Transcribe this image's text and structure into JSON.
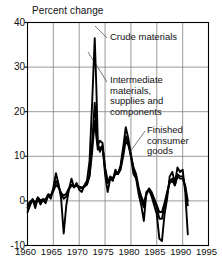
{
  "chart_data": {
    "type": "line",
    "title": "Percent change",
    "xlabel": "",
    "ylabel": "",
    "xlim": [
      1960,
      1995
    ],
    "ylim": [
      -10,
      40
    ],
    "grid": true,
    "legend_position": "inline-annotations",
    "x_ticks": [
      "1960",
      "1965",
      "1970",
      "1975",
      "1980",
      "1985",
      "1990",
      "1995"
    ],
    "x_tick_values": [
      1960,
      1965,
      1970,
      1975,
      1980,
      1985,
      1990,
      1995
    ],
    "y_ticks": [
      "-10",
      "0",
      "10",
      "20",
      "30",
      "40"
    ],
    "y_tick_values": [
      -10,
      0,
      10,
      20,
      30,
      40
    ],
    "annotations": [
      {
        "name": "crude-materials",
        "text": "Crude materials",
        "lines": [
          "Crude materials"
        ]
      },
      {
        "name": "intermediate-materials",
        "text": "Intermediate materials, supplies and components",
        "lines": [
          "Intermediate",
          "materials,",
          "supplies and",
          "components"
        ]
      },
      {
        "name": "finished-consumer-goods",
        "text": "Finished consumer goods",
        "lines": [
          "Finished",
          "consumer",
          "goods"
        ]
      }
    ],
    "x": [
      1960.0,
      1960.5,
      1961.0,
      1961.5,
      1962.0,
      1962.5,
      1963.0,
      1963.5,
      1964.0,
      1964.5,
      1965.0,
      1965.5,
      1966.0,
      1966.5,
      1967.0,
      1967.5,
      1968.0,
      1968.5,
      1969.0,
      1969.5,
      1970.0,
      1970.5,
      1971.0,
      1971.5,
      1972.0,
      1972.5,
      1973.0,
      1973.3,
      1973.6,
      1974.0,
      1974.5,
      1975.0,
      1975.5,
      1976.0,
      1976.5,
      1977.0,
      1977.5,
      1978.0,
      1978.5,
      1979.0,
      1979.5,
      1980.0,
      1980.5,
      1981.0,
      1981.5,
      1982.0,
      1982.5,
      1983.0,
      1983.5,
      1984.0,
      1984.5,
      1985.0,
      1985.5,
      1986.0,
      1986.5,
      1987.0,
      1987.5,
      1988.0,
      1988.5,
      1989.0,
      1989.5,
      1990.0,
      1990.5,
      1991.0
    ],
    "series": [
      {
        "name": "Crude materials",
        "values": [
          -2.5,
          -1.0,
          0.4,
          -1.6,
          0.6,
          -0.8,
          0.2,
          -0.5,
          1.2,
          0.5,
          3.0,
          6.2,
          3.8,
          0.5,
          -7.3,
          -1.0,
          2.5,
          5.0,
          3.0,
          4.0,
          2.5,
          2.0,
          3.5,
          4.5,
          9.0,
          22.0,
          36.5,
          26.0,
          13.0,
          11.0,
          12.5,
          6.0,
          2.0,
          5.0,
          4.5,
          7.0,
          6.0,
          8.0,
          12.0,
          16.5,
          14.0,
          10.0,
          6.0,
          5.0,
          1.5,
          -1.0,
          -4.5,
          2.0,
          2.5,
          1.0,
          -1.0,
          -3.0,
          -8.5,
          -9.0,
          -3.0,
          0.5,
          5.5,
          6.5,
          4.0,
          7.5,
          6.5,
          7.0,
          2.0,
          -7.5
        ]
      },
      {
        "name": "Intermediate materials, supplies and components",
        "values": [
          -1.5,
          -0.5,
          0.2,
          -0.8,
          0.8,
          -0.2,
          0.3,
          0.1,
          1.5,
          1.2,
          2.6,
          4.5,
          3.4,
          1.5,
          0.5,
          1.0,
          2.5,
          3.6,
          3.3,
          3.5,
          3.0,
          2.8,
          3.4,
          3.8,
          6.0,
          13.0,
          22.0,
          17.0,
          12.5,
          13.5,
          13.0,
          7.0,
          4.0,
          5.5,
          5.0,
          6.5,
          6.2,
          7.5,
          11.0,
          14.5,
          13.0,
          10.5,
          7.0,
          5.5,
          2.5,
          0.5,
          -1.5,
          1.5,
          2.5,
          1.5,
          0.0,
          -1.5,
          -4.0,
          -4.0,
          -1.0,
          1.5,
          4.5,
          5.0,
          3.5,
          6.0,
          5.5,
          5.5,
          3.0,
          -1.0
        ]
      },
      {
        "name": "Finished consumer goods",
        "values": [
          -0.8,
          -0.2,
          0.3,
          -0.4,
          0.7,
          0.1,
          0.4,
          0.3,
          1.3,
          1.0,
          2.2,
          3.6,
          3.0,
          1.8,
          1.2,
          1.6,
          2.8,
          3.4,
          3.2,
          3.4,
          3.2,
          3.0,
          3.2,
          3.6,
          5.5,
          11.0,
          18.0,
          14.5,
          11.5,
          12.0,
          12.0,
          7.5,
          4.5,
          5.0,
          4.8,
          6.0,
          6.0,
          7.0,
          10.0,
          13.5,
          12.5,
          10.0,
          7.5,
          6.0,
          3.0,
          1.0,
          -0.5,
          1.8,
          2.8,
          2.0,
          0.5,
          -1.0,
          -2.5,
          -2.5,
          -0.5,
          2.0,
          4.0,
          4.5,
          3.5,
          5.5,
          5.0,
          5.0,
          3.5,
          0.0
        ]
      }
    ]
  },
  "colors": {
    "line": "#000000",
    "grid": "#808080",
    "axis": "#000000",
    "text": "#111111",
    "background": "#ffffff"
  }
}
